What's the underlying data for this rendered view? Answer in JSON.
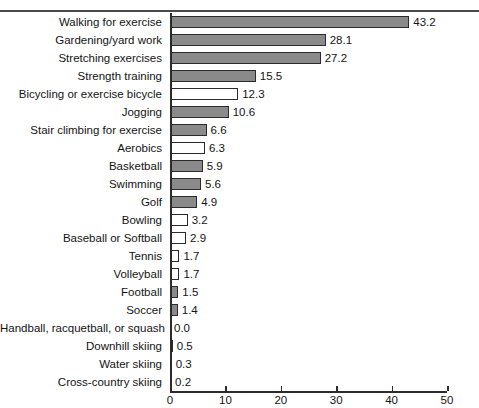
{
  "chart_data": {
    "type": "bar",
    "orientation": "horizontal",
    "title": "",
    "xlabel": "",
    "ylabel": "",
    "xlim": [
      0,
      50
    ],
    "xticks": [
      0,
      10,
      20,
      30,
      40,
      50
    ],
    "xtick_labels": [
      "0",
      "10",
      "20",
      "30",
      "40",
      "50"
    ],
    "grid": false,
    "legend": null,
    "categories": [
      "Walking for exercise",
      "Gardening/yard work",
      "Stretching exercises",
      "Strength training",
      "Bicycling or exercise bicycle",
      "Jogging",
      "Stair climbing for exercise",
      "Aerobics",
      "Basketball",
      "Swimming",
      "Golf",
      "Bowling",
      "Baseball or Softball",
      "Tennis",
      "Volleyball",
      "Football",
      "Soccer",
      "Handball, racquetball, or squash",
      "Downhill skiing",
      "Water skiing",
      "Cross-country skiing"
    ],
    "values": [
      43.2,
      28.1,
      27.2,
      15.5,
      12.3,
      10.6,
      6.6,
      6.3,
      5.9,
      5.6,
      4.9,
      3.2,
      2.9,
      1.7,
      1.7,
      1.5,
      1.4,
      0.0,
      0.5,
      0.3,
      0.2
    ],
    "value_labels": [
      "43.2",
      "28.1",
      "27.2",
      "15.5",
      "12.3",
      "10.6",
      "6.6",
      "6.3",
      "5.9",
      "5.6",
      "4.9",
      "3.2",
      "2.9",
      "1.7",
      "1.7",
      "1.5",
      "1.4",
      "0.0",
      "0.5",
      "0.3",
      "0.2"
    ],
    "bar_fills": [
      "gray",
      "gray",
      "gray",
      "gray",
      "white",
      "gray",
      "gray",
      "white",
      "gray",
      "gray",
      "gray",
      "white",
      "white",
      "white",
      "white",
      "gray",
      "gray",
      "none",
      "gray",
      "gray",
      "gray"
    ],
    "colors": {
      "bar_gray": "#8a8a8a",
      "bar_white": "#ffffff",
      "bar_outline": "#2b2b2b",
      "axis": "#2b2b2b",
      "text": "#141414",
      "rule": "#4a4a4a",
      "background": "#ffffff"
    }
  }
}
